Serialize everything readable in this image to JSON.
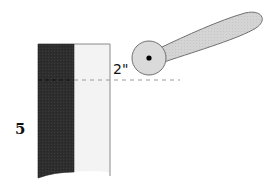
{
  "diagram": {
    "labels": {
      "dimension": "2\"",
      "side_number": "5"
    },
    "elements": {
      "dark_panel": {
        "fill": "#2e2e2e",
        "description": "dark vertical panel"
      },
      "light_panel": {
        "fill": "#f2f2f2",
        "stroke": "#8a8a8a",
        "description": "light vertical panel"
      },
      "reference_line": {
        "style": "dashed",
        "color": "#9a9a9a"
      },
      "pivot_circle": {
        "fill": "#d9d9d9",
        "stroke": "#7a7a7a"
      },
      "pivot_dot": {
        "fill": "#000000"
      },
      "arm_paddle": {
        "fill": "#d4d4d4",
        "stroke": "#7a7a7a"
      }
    }
  }
}
